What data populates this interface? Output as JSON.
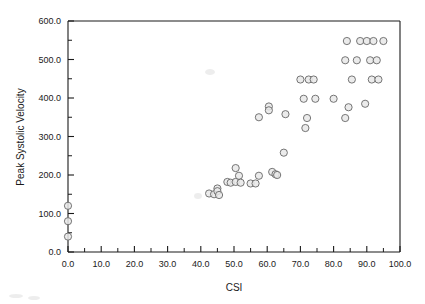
{
  "chart_data": {
    "type": "scatter",
    "title": "",
    "xlabel": "CSI",
    "ylabel": "Peak Systolic Velocity",
    "xlim": [
      0,
      100
    ],
    "ylim": [
      0,
      600
    ],
    "grid": false,
    "legend": null,
    "xticks": [
      0,
      10,
      20,
      30,
      40,
      50,
      60,
      70,
      80,
      90,
      100
    ],
    "xtick_labels": [
      "0.0",
      "10.0",
      "20.0",
      "30.0",
      "40.0",
      "50.0",
      "60.0",
      "70.0",
      "80.0",
      "90.0",
      "100.0"
    ],
    "yticks": [
      0,
      100,
      200,
      300,
      400,
      500,
      600
    ],
    "ytick_labels": [
      "0.0",
      "100.0",
      "200.0",
      "300.0",
      "400.0",
      "500.0",
      "600.0"
    ],
    "x_minor_interval": 5,
    "y_minor_interval": 50,
    "marker": "open-circle",
    "marker_fill": "#e8e8e8",
    "marker_stroke": "#666666",
    "points": [
      {
        "x": 0.0,
        "y": 120
      },
      {
        "x": 0.0,
        "y": 80
      },
      {
        "x": 0.0,
        "y": 40
      },
      {
        "x": 42.5,
        "y": 152
      },
      {
        "x": 44.0,
        "y": 150
      },
      {
        "x": 45.0,
        "y": 165
      },
      {
        "x": 45.0,
        "y": 158
      },
      {
        "x": 45.5,
        "y": 148
      },
      {
        "x": 48.0,
        "y": 182
      },
      {
        "x": 49.0,
        "y": 180
      },
      {
        "x": 50.5,
        "y": 218
      },
      {
        "x": 50.5,
        "y": 182
      },
      {
        "x": 51.5,
        "y": 198
      },
      {
        "x": 52.0,
        "y": 180
      },
      {
        "x": 55.0,
        "y": 178
      },
      {
        "x": 56.5,
        "y": 178
      },
      {
        "x": 57.5,
        "y": 198
      },
      {
        "x": 57.5,
        "y": 350
      },
      {
        "x": 60.5,
        "y": 378
      },
      {
        "x": 60.5,
        "y": 368
      },
      {
        "x": 61.5,
        "y": 208
      },
      {
        "x": 62.5,
        "y": 202
      },
      {
        "x": 63.0,
        "y": 200
      },
      {
        "x": 65.0,
        "y": 258
      },
      {
        "x": 65.5,
        "y": 358
      },
      {
        "x": 70.0,
        "y": 448
      },
      {
        "x": 71.0,
        "y": 398
      },
      {
        "x": 71.5,
        "y": 322
      },
      {
        "x": 72.0,
        "y": 348
      },
      {
        "x": 72.5,
        "y": 448
      },
      {
        "x": 74.0,
        "y": 448
      },
      {
        "x": 74.5,
        "y": 398
      },
      {
        "x": 80.0,
        "y": 398
      },
      {
        "x": 83.5,
        "y": 348
      },
      {
        "x": 83.5,
        "y": 498
      },
      {
        "x": 84.0,
        "y": 548
      },
      {
        "x": 84.5,
        "y": 376
      },
      {
        "x": 85.5,
        "y": 448
      },
      {
        "x": 87.0,
        "y": 498
      },
      {
        "x": 88.0,
        "y": 548
      },
      {
        "x": 89.5,
        "y": 385
      },
      {
        "x": 90.0,
        "y": 548
      },
      {
        "x": 91.0,
        "y": 498
      },
      {
        "x": 91.5,
        "y": 448
      },
      {
        "x": 92.0,
        "y": 548
      },
      {
        "x": 93.0,
        "y": 498
      },
      {
        "x": 93.5,
        "y": 448
      },
      {
        "x": 95.0,
        "y": 548
      }
    ]
  },
  "axes": {
    "x_axis_title": "CSI",
    "y_axis_title": "Peak Systolic Velocity"
  }
}
